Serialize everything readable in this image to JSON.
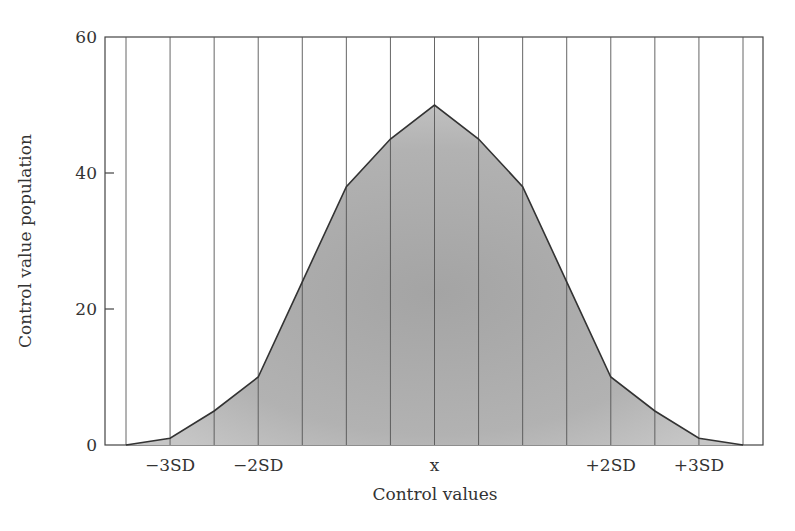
{
  "chart_data": {
    "type": "area",
    "title": "",
    "xlabel": "Control values",
    "ylabel": "Control value population",
    "ylim": [
      0,
      60
    ],
    "yticks": [
      0,
      20,
      40,
      60
    ],
    "grid": "vertical lines at each data point",
    "legend": null,
    "x_positions": [
      -3.5,
      -3,
      -2.5,
      -2,
      -1.5,
      -1,
      -0.5,
      0,
      0.5,
      1,
      1.5,
      2,
      2.5,
      3,
      3.5
    ],
    "values": [
      0,
      1,
      5,
      10,
      24,
      38,
      45,
      50,
      45,
      38,
      24,
      10,
      5,
      1,
      0
    ],
    "xtick_labels": [
      {
        "pos": -3,
        "label": "−3SD"
      },
      {
        "pos": -2,
        "label": "−2SD"
      },
      {
        "pos": 0,
        "label": "x"
      },
      {
        "pos": 2,
        "label": "+2SD"
      },
      {
        "pos": 3,
        "label": "+3SD"
      }
    ],
    "fill_color": "#a8a8a8",
    "line_color": "#333333"
  }
}
